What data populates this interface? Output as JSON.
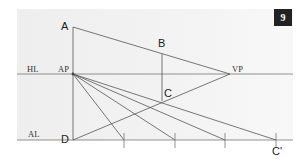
{
  "figure": {
    "badge": "9",
    "labels": {
      "A": "A",
      "B": "B",
      "C": "C",
      "D": "D",
      "C_prime": "C'",
      "AP": "AP",
      "VP": "VP",
      "HL": "HL",
      "AL": "AL"
    },
    "points": {
      "A": [
        73,
        27
      ],
      "B": [
        162,
        54
      ],
      "C": [
        162,
        101
      ],
      "D": [
        73,
        140
      ],
      "AP": [
        73,
        74
      ],
      "VP": [
        230,
        74
      ],
      "C_prime": [
        276,
        140
      ]
    },
    "ticks_x": [
      124,
      175,
      225,
      276
    ],
    "colors": {
      "panel": "#efefef",
      "line": "#555555",
      "badge": "#222222"
    }
  }
}
